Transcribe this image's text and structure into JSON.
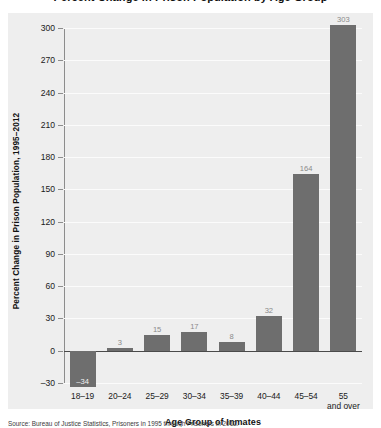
{
  "figure": {
    "title": "Percent Change in Prison Population by Age Group",
    "source": "Source: Bureau of Justice Statistics, Prisoners in 1995 through Prisoners in 2012."
  },
  "chart_data": {
    "type": "bar",
    "title": "Percent Change in Prison Population by Age Group",
    "categories": [
      "18–19",
      "20–24",
      "25–29",
      "30–34",
      "35–39",
      "40–44",
      "45–54",
      "55 and over"
    ],
    "values": [
      -34,
      3,
      15,
      17,
      8,
      32,
      164,
      303
    ],
    "value_labels": [
      "–34",
      "3",
      "15",
      "17",
      "8",
      "32",
      "164",
      "303"
    ],
    "xlabel": "Age Group of Inmates",
    "ylabel": "Percent Change in Prison Population, 1995–2012",
    "ylim": [
      -30,
      300
    ],
    "yticks": [
      300,
      270,
      240,
      210,
      180,
      150,
      120,
      90,
      60,
      30,
      0,
      -30
    ],
    "ytick_labels": [
      "300",
      "270",
      "240",
      "210",
      "180",
      "150",
      "120",
      "90",
      "60",
      "30",
      "0",
      "–30"
    ],
    "grid": true,
    "legend": "none",
    "colors": {
      "bar": "#6e6e6e",
      "panel_background": "#eeeeee",
      "gridline": "#fbfbfb",
      "axis": "#8c8c8c",
      "zero_line": "#4a4a4a",
      "value_label": "#8a8a8a",
      "value_label_inside": "#f2f2f2",
      "text": "#111111"
    }
  }
}
